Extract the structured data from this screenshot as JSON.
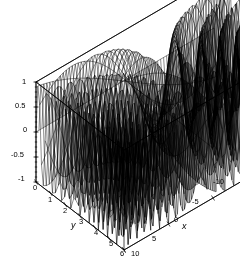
{
  "figure": {
    "type": "3d-surface-wireframe",
    "title": "",
    "renderer": "mesh-wireframe",
    "line_color": "#000000",
    "background_color": "#ffffff",
    "box_color": "#000000"
  },
  "axes": {
    "x": {
      "name": "x",
      "min": -10,
      "max": 10,
      "ticks": [
        10,
        5,
        0,
        -5,
        -10
      ],
      "tick_labels": [
        "10",
        "5",
        "0",
        "-5",
        "-10"
      ],
      "direction": "front-left-to-back-right"
    },
    "y": {
      "name": "y",
      "min": 0,
      "max": 6,
      "ticks": [
        0,
        1,
        2,
        3,
        4,
        5,
        6
      ],
      "tick_labels": [
        "0",
        "1",
        "2",
        "3",
        "4",
        "5",
        "6"
      ],
      "direction": "back-left-to-front-right"
    },
    "z": {
      "name": "",
      "min": -1,
      "max": 1,
      "ticks": [
        1,
        0.5,
        0,
        -0.5,
        -1
      ],
      "tick_labels": [
        "1",
        "0.5",
        "0",
        "-0.5",
        "-1"
      ],
      "direction": "vertical"
    }
  },
  "chart_data": {
    "type": "surface",
    "title": "",
    "xlabel": "x",
    "ylabel": "y",
    "zlabel": "",
    "xlim": [
      -10,
      10
    ],
    "ylim": [
      0,
      6
    ],
    "zlim": [
      -1,
      1
    ],
    "grid": false,
    "legend": "none",
    "mesh": {
      "x_samples": 60,
      "y_samples": 48
    },
    "function": "sin(x*y)",
    "view": {
      "azimuth": -60,
      "elevation": 28
    }
  },
  "tick_positions": {
    "z": [
      {
        "label": "1",
        "x": 22,
        "y": 78
      },
      {
        "label": "0.5",
        "x": 15,
        "y": 102
      },
      {
        "label": "0",
        "x": 23,
        "y": 126
      },
      {
        "label": "-0.5",
        "x": 11,
        "y": 151
      },
      {
        "label": "-1",
        "x": 18,
        "y": 175
      }
    ],
    "y": [
      {
        "label": "0",
        "x": 33,
        "y": 184
      },
      {
        "label": "1",
        "x": 48,
        "y": 196
      },
      {
        "label": "2",
        "x": 63,
        "y": 207
      },
      {
        "label": "3",
        "x": 79,
        "y": 218
      },
      {
        "label": "4",
        "x": 94,
        "y": 229
      },
      {
        "label": "5",
        "x": 109,
        "y": 240
      },
      {
        "label": "6",
        "x": 120,
        "y": 250
      }
    ],
    "x": [
      {
        "label": "10",
        "x": 131,
        "y": 250
      },
      {
        "label": "5",
        "x": 152,
        "y": 235
      },
      {
        "label": "0",
        "x": 174,
        "y": 216
      },
      {
        "label": "-5",
        "x": 192,
        "y": 198
      },
      {
        "label": "-10",
        "x": 213,
        "y": 178
      }
    ]
  },
  "axis_names": {
    "y_name": {
      "label": "y",
      "x": 71,
      "y": 221
    },
    "x_name": {
      "label": "x",
      "x": 182,
      "y": 222
    }
  }
}
